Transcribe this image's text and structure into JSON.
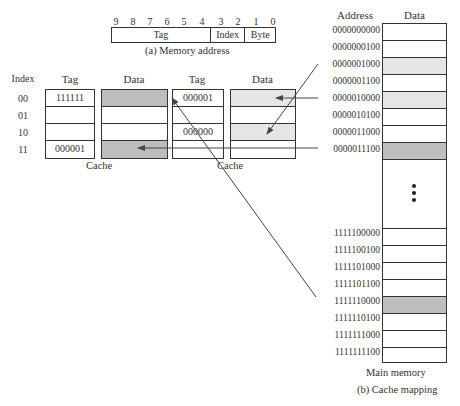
{
  "memory_address": {
    "bit_numbers": [
      "9",
      "8",
      "7",
      "6",
      "5",
      "4",
      "3",
      "2",
      "1",
      "0"
    ],
    "fields": [
      {
        "label": "Tag",
        "bits": 6
      },
      {
        "label": "Index",
        "bits": 2
      },
      {
        "label": "Byte",
        "bits": 2
      }
    ],
    "caption": "(a) Memory address"
  },
  "cache_1": {
    "index_header": "Index",
    "tag_header": "Tag",
    "data_header": "Data",
    "rows": [
      {
        "index": "00",
        "tag": "111111",
        "data_shade": "dark"
      },
      {
        "index": "01",
        "tag": "",
        "data_shade": "none"
      },
      {
        "index": "10",
        "tag": "",
        "data_shade": "none"
      },
      {
        "index": "11",
        "tag": "000001",
        "data_shade": "dark"
      }
    ],
    "caption": "Cache"
  },
  "cache_2": {
    "tag_header": "Tag",
    "data_header": "Data",
    "rows": [
      {
        "index": "00",
        "tag": "000001",
        "data_shade": "light"
      },
      {
        "index": "01",
        "tag": "",
        "data_shade": "none"
      },
      {
        "index": "10",
        "tag": "000000",
        "data_shade": "light"
      },
      {
        "index": "11",
        "tag": "",
        "data_shade": "none"
      }
    ],
    "caption": "Cache"
  },
  "main_memory": {
    "address_header": "Address",
    "data_header": "Data",
    "top_rows": [
      {
        "address": "0000000000",
        "shade": "none"
      },
      {
        "address": "0000000100",
        "shade": "none"
      },
      {
        "address": "0000001000",
        "shade": "light"
      },
      {
        "address": "0000001100",
        "shade": "none"
      },
      {
        "address": "0000010000",
        "shade": "light"
      },
      {
        "address": "0000010100",
        "shade": "none"
      },
      {
        "address": "0000011000",
        "shade": "none"
      },
      {
        "address": "0000011100",
        "shade": "dark"
      }
    ],
    "ellipsis": "⋮",
    "bottom_rows": [
      {
        "address": "1111100000",
        "shade": "none"
      },
      {
        "address": "1111100100",
        "shade": "none"
      },
      {
        "address": "1111101000",
        "shade": "none"
      },
      {
        "address": "1111101100",
        "shade": "none"
      },
      {
        "address": "1111110000",
        "shade": "dark"
      },
      {
        "address": "1111110100",
        "shade": "none"
      },
      {
        "address": "1111111000",
        "shade": "none"
      },
      {
        "address": "1111111100",
        "shade": "none"
      }
    ],
    "caption": "Main memory",
    "figure_caption": "(b) Cache mapping"
  },
  "colors": {
    "dark_shade": "#bdbdbd",
    "light_shade": "#e6e6e6",
    "line": "#333333"
  }
}
